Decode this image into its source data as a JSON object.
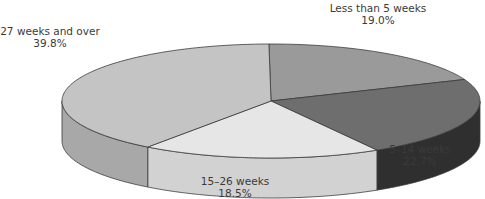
{
  "chart_data": {
    "type": "pie",
    "style": "3d",
    "title": "",
    "categories": [
      "Less than 5 weeks",
      "5–14 weeks",
      "15–26 weeks",
      "27 weeks and over"
    ],
    "values": [
      19.0,
      22.7,
      18.5,
      39.8
    ],
    "value_labels": [
      "19.0%",
      "22.7%",
      "18.5%",
      "39.8%"
    ],
    "colors": [
      "#9a9a9a",
      "#6e6e6e",
      "#e6e6e6",
      "#c4c4c4"
    ],
    "side_colors": [
      "#7d7d7d",
      "#2f2f2f",
      "#d2d2d2",
      "#a8a8a8"
    ],
    "legend": "none",
    "labels_position": "outside"
  },
  "labels": {
    "s0": {
      "name": "Less than 5 weeks",
      "pct": "19.0%"
    },
    "s1": {
      "name": "5–14 weeks",
      "pct": "22.7%"
    },
    "s2": {
      "name": "15–26 weeks",
      "pct": "18.5%"
    },
    "s3": {
      "name": "27 weeks and over",
      "pct": "39.8%"
    }
  }
}
